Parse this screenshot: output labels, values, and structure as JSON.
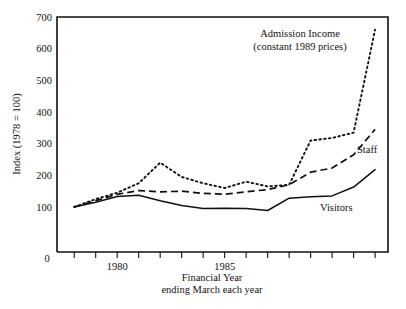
{
  "chart_data": {
    "type": "line",
    "title": "",
    "xlabel": "Financial Year\nending March each year",
    "xlabel_line1": "Financial Year",
    "xlabel_line2": "ending March each year",
    "ylabel": "Index (1978 = 100)",
    "ylim": [
      0,
      700
    ],
    "ytick_labels": [
      "0",
      "100",
      "200",
      "300",
      "400",
      "500",
      "600",
      "700"
    ],
    "ytick_values": [
      0,
      100,
      200,
      300,
      400,
      500,
      600,
      700
    ],
    "grid": false,
    "legend_position": "inline-annotations",
    "x": [
      1978,
      1979,
      1980,
      1981,
      1982,
      1983,
      1984,
      1985,
      1986,
      1987,
      1988,
      1989,
      1990,
      1991,
      1992
    ],
    "xtick_labels": [
      "1980",
      "1985"
    ],
    "xtick_label_values": [
      1980,
      1985
    ],
    "origin_label": "0",
    "xlim": [
      1977.2,
      1992.6
    ],
    "series": [
      {
        "name": "Admission Income",
        "style": "dotted",
        "annotation_line1": "Admission Income",
        "annotation_line2": "(constant 1989 prices)",
        "values": [
          100,
          125,
          145,
          175,
          240,
          195,
          175,
          160,
          180,
          165,
          170,
          310,
          318,
          335,
          660
        ]
      },
      {
        "name": "Staff",
        "style": "dashed",
        "annotation_line1": "Staff",
        "annotation_line2": "",
        "values": [
          100,
          120,
          140,
          152,
          148,
          150,
          143,
          140,
          148,
          155,
          170,
          210,
          223,
          265,
          345
        ]
      },
      {
        "name": "Visitors",
        "style": "solid",
        "annotation_line1": "Visitors",
        "annotation_line2": "",
        "values": [
          100,
          115,
          133,
          137,
          120,
          105,
          95,
          96,
          95,
          89,
          128,
          132,
          135,
          163,
          218
        ]
      }
    ],
    "colors": {
      "ink": "#111111",
      "background": "#ffffff"
    }
  }
}
